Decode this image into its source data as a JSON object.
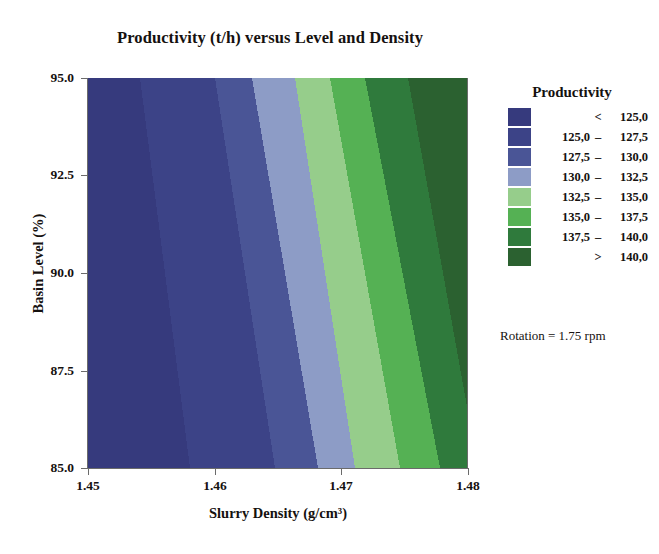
{
  "chart_data": {
    "type": "contour",
    "title": "Productivity (t/h) versus Level and Density",
    "xlabel": "Slurry Density (g/cm³)",
    "ylabel": "Basin Level (%)",
    "xlim": [
      1.45,
      1.48
    ],
    "ylim": [
      85.0,
      95.0
    ],
    "xticks": [
      "1.45",
      "1.46",
      "1.47",
      "1.48"
    ],
    "xtick_values": [
      1.45,
      1.46,
      1.47,
      1.48
    ],
    "yticks": [
      "95.0",
      "92.5",
      "90.0",
      "87.5",
      "85.0"
    ],
    "ytick_values": [
      95.0,
      92.5,
      90.0,
      87.5,
      85.0
    ],
    "grid": false,
    "legend_position": "right",
    "legend_title": "Productivity",
    "annotation": "Rotation = 1.75 rpm",
    "zvariable": "Productivity (t/h)",
    "levels": [
      125.0,
      127.5,
      130.0,
      132.5,
      135.0,
      137.5,
      140.0
    ],
    "bands": [
      {
        "label_lo": "",
        "label_op": "<",
        "label_hi": "125,0",
        "color": "#363a7d",
        "z_min": null,
        "z_max": 125.0
      },
      {
        "label_lo": "125,0",
        "label_op": "–",
        "label_hi": "127,5",
        "color": "#3c4387",
        "z_min": 125.0,
        "z_max": 127.5
      },
      {
        "label_lo": "127,5",
        "label_op": "–",
        "label_hi": "130,0",
        "color": "#4a5596",
        "z_min": 127.5,
        "z_max": 130.0
      },
      {
        "label_lo": "130,0",
        "label_op": "–",
        "label_hi": "132,5",
        "color": "#8d9cc6",
        "z_min": 130.0,
        "z_max": 132.5
      },
      {
        "label_lo": "132,5",
        "label_op": "–",
        "label_hi": "135,0",
        "color": "#96cd8b",
        "z_min": 132.5,
        "z_max": 135.0
      },
      {
        "label_lo": "135,0",
        "label_op": "–",
        "label_hi": "137,5",
        "color": "#55b154",
        "z_min": 135.0,
        "z_max": 137.5
      },
      {
        "label_lo": "137,5",
        "label_op": "–",
        "label_hi": "140,0",
        "color": "#2f7a3c",
        "z_min": 137.5,
        "z_max": 140.0
      },
      {
        "label_lo": "",
        "label_op": ">",
        "label_hi": "140,0",
        "color": "#2b6130",
        "z_min": 140.0,
        "z_max": null
      }
    ],
    "band_boundaries_px": [
      {
        "level": 125.0,
        "top_x": 140,
        "bottom_x": 190
      },
      {
        "level": 127.5,
        "top_x": 215,
        "bottom_x": 275
      },
      {
        "level": 130.0,
        "top_x": 252,
        "bottom_x": 318
      },
      {
        "level": 132.5,
        "top_x": 295,
        "bottom_x": 355
      },
      {
        "level": 135.0,
        "top_x": 330,
        "bottom_x": 400
      },
      {
        "level": 137.5,
        "top_x": 365,
        "bottom_x": 440
      },
      {
        "level": 140.0,
        "top_x": 408,
        "bottom_x": 478
      }
    ]
  }
}
